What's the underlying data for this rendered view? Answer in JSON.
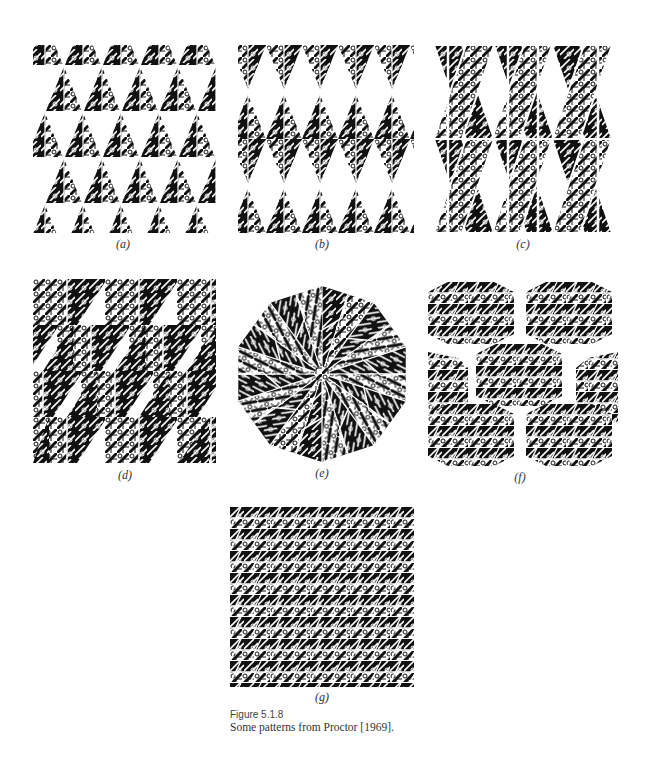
{
  "figure": {
    "number": "Figure 5.1.8",
    "caption": "Some patterns from Proctor [1969]."
  },
  "panels": [
    {
      "id": "a",
      "label": "(a)",
      "description": "triangular motif tiles in rows of upward triangles"
    },
    {
      "id": "b",
      "label": "(b)",
      "description": "triangles arranged as vertical diamonds (bow-tie columns)"
    },
    {
      "id": "c",
      "label": "(c)",
      "description": "interlaced triangular strips forming lattice of diamonds"
    },
    {
      "id": "d",
      "label": "(d)",
      "description": "parallelogram tiles in staggered rows"
    },
    {
      "id": "e",
      "label": "(e)",
      "description": "rosette of triangles forming a decagon"
    },
    {
      "id": "f",
      "label": "(f)",
      "description": "hexagonal tiles with banded triangle motif"
    },
    {
      "id": "g",
      "label": "(g)",
      "description": "dense periodic tiling of banded triangles"
    }
  ],
  "colors": {
    "ink": "#111111",
    "paper": "#ffffff"
  }
}
